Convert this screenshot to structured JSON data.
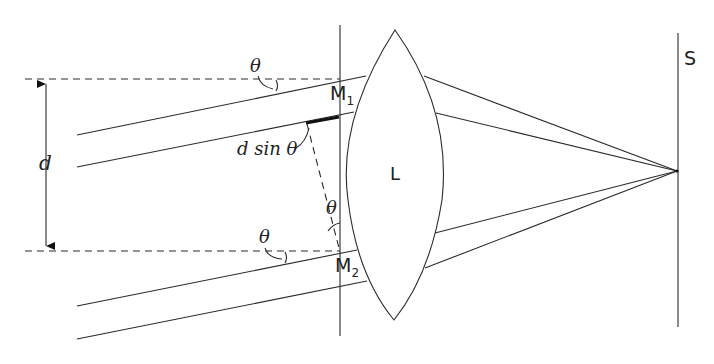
{
  "diagram": {
    "labels": {
      "theta_top": "θ",
      "theta_bottom": "θ",
      "theta_mid": "θ",
      "d": "d",
      "d_sin_theta": "d sin θ",
      "m1": "M",
      "m1_sub": "1",
      "m2": "M",
      "m2_sub": "2",
      "lens": "L",
      "screen": "S"
    },
    "colors": {
      "line": "#2a2a2a",
      "background": "#ffffff"
    }
  }
}
